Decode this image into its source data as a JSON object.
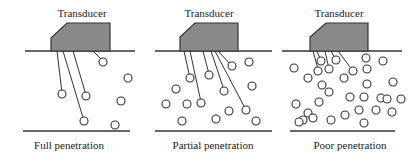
{
  "diagram": {
    "colors": {
      "transducer_fill": "#8a8a8a",
      "line": "#333333"
    },
    "panels": [
      {
        "title": "Transducer",
        "caption": "Full penetration",
        "offset_x": 0,
        "surface": [
          25,
          135
        ],
        "bottom": [
          23,
          130
        ],
        "surface_y": 51,
        "bottom_y": 131,
        "transducer": {
          "x1": 51,
          "x2": 110,
          "bevel_x": 67,
          "top_y": 23,
          "bevel_y": 38,
          "bottom_y": 51
        },
        "rays": [
          {
            "from": [
              57,
              51
            ],
            "to": [
              62,
              93
            ]
          },
          {
            "from": [
              63,
              51
            ],
            "to": [
              84,
              121
            ]
          },
          {
            "from": [
              73,
              51
            ],
            "to": [
              86,
              95
            ]
          },
          {
            "from": [
              93,
              51
            ],
            "to": [
              103,
              61
            ]
          }
        ],
        "particles": [
          [
            62,
            94
          ],
          [
            86,
            96
          ],
          [
            84,
            121
          ],
          [
            103,
            62
          ],
          [
            128,
            78
          ],
          [
            121,
            101
          ],
          [
            115,
            125
          ]
        ]
      },
      {
        "title": "Transducer",
        "caption": "Partial penetration",
        "offset_x": 0,
        "surface": [
          155,
          272
        ],
        "bottom": [
          155,
          272
        ],
        "surface_y": 51,
        "bottom_y": 131,
        "transducer": {
          "x1": 180,
          "x2": 238,
          "bevel_x": 195,
          "top_y": 23,
          "bevel_y": 37,
          "bottom_y": 51
        },
        "rays": [
          {
            "from": [
              184,
              51
            ],
            "to": [
              190,
              78
            ]
          },
          {
            "from": [
              190,
              51
            ],
            "to": [
              201,
              102
            ]
          },
          {
            "from": [
              203,
              51
            ],
            "to": [
              209,
              74
            ]
          },
          {
            "from": [
              211,
              51
            ],
            "to": [
              224,
              90
            ]
          },
          {
            "from": [
              215,
              51
            ],
            "to": [
              246,
              110
            ]
          },
          {
            "from": [
              218,
              51
            ],
            "to": [
              232,
              66
            ]
          }
        ],
        "particles": [
          [
            190,
            78
          ],
          [
            176,
            89
          ],
          [
            166,
            104
          ],
          [
            187,
            104
          ],
          [
            201,
            103
          ],
          [
            209,
            75
          ],
          [
            224,
            91
          ],
          [
            232,
            66
          ],
          [
            249,
            62
          ],
          [
            252,
            86
          ],
          [
            246,
            110
          ],
          [
            256,
            121
          ],
          [
            229,
            111
          ],
          [
            216,
            119
          ],
          [
            182,
            121
          ]
        ]
      },
      {
        "title": "Transducer",
        "caption": "Poor penetration",
        "offset_x": 0,
        "surface": [
          282,
          402
        ],
        "bottom": [
          290,
          395
        ],
        "surface_y": 51,
        "bottom_y": 131,
        "transducer": {
          "x1": 310,
          "x2": 368,
          "bevel_x": 326,
          "top_y": 23,
          "bevel_y": 37,
          "bottom_y": 51
        },
        "rays": [
          {
            "from": [
              313,
              51
            ],
            "to": [
              318,
              69
            ]
          },
          {
            "from": [
              317,
              51
            ],
            "to": [
              321,
              61
            ]
          },
          {
            "from": [
              325,
              51
            ],
            "to": [
              329,
              69
            ]
          },
          {
            "from": [
              331,
              51
            ],
            "to": [
              336,
              60
            ]
          },
          {
            "from": [
              338,
              51
            ],
            "to": [
              353,
              71
            ]
          }
        ],
        "particles": [
          [
            321,
            61
          ],
          [
            336,
            60
          ],
          [
            294,
            68
          ],
          [
            318,
            71
          ],
          [
            329,
            69
          ],
          [
            353,
            71
          ],
          [
            366,
            58
          ],
          [
            383,
            61
          ],
          [
            367,
            69
          ],
          [
            308,
            78
          ],
          [
            322,
            85
          ],
          [
            344,
            78
          ],
          [
            367,
            84
          ],
          [
            393,
            82
          ],
          [
            350,
            97
          ],
          [
            329,
            92
          ],
          [
            364,
            97
          ],
          [
            381,
            98
          ],
          [
            387,
            99
          ],
          [
            401,
            99
          ],
          [
            296,
            104
          ],
          [
            308,
            113
          ],
          [
            319,
            102
          ],
          [
            345,
            115
          ],
          [
            359,
            110
          ],
          [
            376,
            110
          ],
          [
            392,
            112
          ],
          [
            303,
            120
          ],
          [
            313,
            118
          ],
          [
            331,
            120
          ],
          [
            364,
            123
          ],
          [
            299,
            122
          ]
        ]
      }
    ]
  }
}
